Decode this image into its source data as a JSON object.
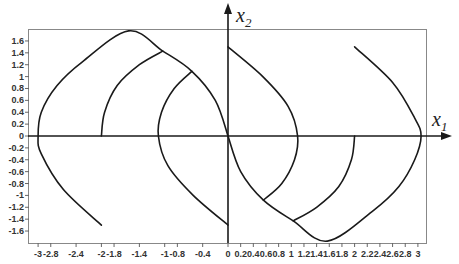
{
  "chart_data": {
    "type": "line",
    "title": "",
    "xlabel": "x1",
    "ylabel": "x2",
    "xlim": [
      -3.15,
      3.15
    ],
    "ylim": [
      -1.8,
      1.8
    ],
    "grid": false,
    "legend": null,
    "x_ticks": [
      -3,
      -2.8,
      -2.4,
      -2,
      -1.8,
      -1.4,
      -1,
      -0.8,
      -0.4,
      0,
      0.2,
      0.4,
      0.6,
      0.8,
      1,
      1.2,
      1.4,
      1.6,
      1.8,
      2,
      2.2,
      2.4,
      2.6,
      2.8,
      3
    ],
    "x_tick_labels": [
      "-3",
      "-2.8",
      "-2.4",
      "-2",
      "-1.8",
      "-1.4",
      "-1",
      "-0.8",
      "-0.4",
      "0",
      "0.2",
      "0.4",
      "0.6",
      "0.8",
      "1",
      "1.2",
      "1.4",
      "1.6",
      "1.8",
      "2",
      "2.2",
      "2.4",
      "2.6",
      "2.8",
      "3"
    ],
    "y_ticks": [
      1.6,
      1.4,
      1.2,
      1,
      0.8,
      0.6,
      0.4,
      0.2,
      0,
      -0.2,
      -0.4,
      -0.6,
      -0.8,
      -1,
      -1.2,
      -1.4,
      -1.6
    ],
    "y_tick_labels": [
      "1.6",
      "1.4",
      "1.2",
      "1",
      "0.8",
      "0.6",
      "0.4",
      "0.2",
      "0",
      "-0.2",
      "-0.4",
      "-0.6",
      "-0.8",
      "-1",
      "-1.2",
      "-1.4",
      "-1.6"
    ],
    "series": [
      {
        "name": "left-outer-trajectory",
        "points": [
          [
            -2.0,
            -1.5
          ],
          [
            -2.6,
            -0.9
          ],
          [
            -2.95,
            -0.3
          ],
          [
            -3.0,
            0.0
          ],
          [
            -2.95,
            0.4
          ],
          [
            -2.7,
            0.85
          ],
          [
            -2.3,
            1.25
          ],
          [
            -1.57,
            1.77
          ],
          [
            -1.03,
            1.43
          ],
          [
            -0.57,
            1.09
          ],
          [
            -0.2,
            0.6
          ],
          [
            0.0,
            0.0
          ]
        ]
      },
      {
        "name": "left-mid-trajectory",
        "points": [
          [
            -2.0,
            0.0
          ],
          [
            -1.95,
            0.4
          ],
          [
            -1.75,
            0.85
          ],
          [
            -1.4,
            1.2
          ],
          [
            -1.03,
            1.43
          ]
        ]
      },
      {
        "name": "left-inner-trajectory",
        "points": [
          [
            0.0,
            -1.5
          ],
          [
            -0.55,
            -1.0
          ],
          [
            -0.95,
            -0.5
          ],
          [
            -1.1,
            0.0
          ],
          [
            -1.05,
            0.4
          ],
          [
            -0.85,
            0.8
          ],
          [
            -0.57,
            1.09
          ]
        ]
      },
      {
        "name": "right-inner-trajectory",
        "points": [
          [
            0.0,
            1.5
          ],
          [
            0.55,
            1.0
          ],
          [
            0.95,
            0.5
          ],
          [
            1.1,
            0.0
          ],
          [
            1.05,
            -0.4
          ],
          [
            0.85,
            -0.8
          ],
          [
            0.56,
            -1.08
          ]
        ]
      },
      {
        "name": "right-mid-trajectory",
        "points": [
          [
            2.0,
            0.0
          ],
          [
            1.95,
            -0.4
          ],
          [
            1.75,
            -0.85
          ],
          [
            1.4,
            -1.2
          ],
          [
            1.03,
            -1.43
          ]
        ]
      },
      {
        "name": "right-outer-trajectory",
        "points": [
          [
            2.0,
            1.5
          ],
          [
            2.6,
            0.9
          ],
          [
            2.95,
            0.3
          ],
          [
            3.05,
            0.0
          ],
          [
            2.95,
            -0.4
          ],
          [
            2.7,
            -0.85
          ],
          [
            2.3,
            -1.25
          ],
          [
            1.57,
            -1.77
          ],
          [
            1.03,
            -1.43
          ],
          [
            0.56,
            -1.08
          ],
          [
            0.2,
            -0.6
          ],
          [
            0.0,
            0.0
          ]
        ]
      }
    ]
  },
  "labels": {
    "x_axis_main": "x",
    "x_axis_sub": "1",
    "y_axis_main": "x",
    "y_axis_sub": "2"
  }
}
